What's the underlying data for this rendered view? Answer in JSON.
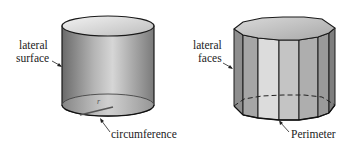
{
  "figures": [
    {
      "name": "cylinder",
      "labels": {
        "lateral_line1": "lateral",
        "lateral_line2": "surface",
        "radius": "r",
        "base": "circumference"
      }
    },
    {
      "name": "prism",
      "labels": {
        "lateral_line1": "lateral",
        "lateral_line2": "faces",
        "base": "Perimeter"
      }
    }
  ]
}
